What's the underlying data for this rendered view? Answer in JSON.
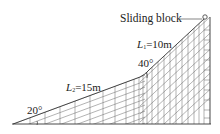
{
  "diagram": {
    "labels": {
      "sliding_block": "Sliding block",
      "L1_var": "L",
      "L1_sub": "1",
      "L1_val": "=10m",
      "L2_var": "L",
      "L2_sub": "2",
      "L2_val": "=15m",
      "angle_upper": "40°",
      "angle_lower": "20°"
    },
    "segments": [
      {
        "name": "L1",
        "length_m": 10,
        "angle_deg": 40,
        "position": "upper"
      },
      {
        "name": "L2",
        "length_m": 15,
        "angle_deg": 20,
        "position": "lower"
      }
    ],
    "colors": {
      "line": "#333333",
      "grid": "#555555",
      "text": "#222222"
    }
  }
}
